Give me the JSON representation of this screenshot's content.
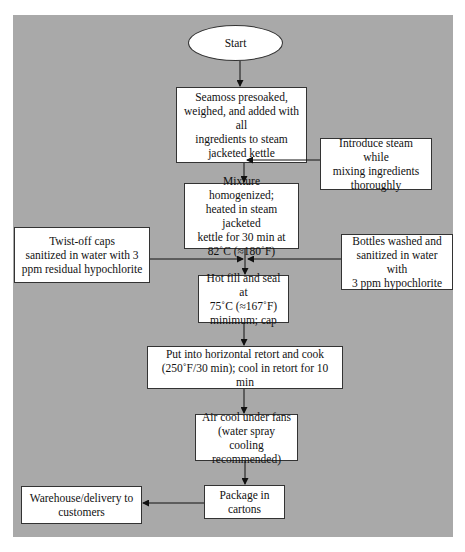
{
  "diagram": {
    "type": "process-flowchart",
    "background_color": "#a9a9a9",
    "nodes": {
      "start": "Start",
      "step1": "Seamoss presoaked,\nweighed, and added with all\ningredients to steam\njacketed kettle",
      "steam_input": "Introduce steam while\nmixing ingredients\nthoroughly",
      "step2": "Mixture homogenized;\nheated in steam jacketed\nkettle for 30 min at\n82˚C (≈180˚F)",
      "caps_input": "Twist-off caps\nsanitized in water with 3\nppm residual hypochlorite",
      "bottles_input": "Bottles washed and\nsanitized in water with\n3 ppm hypochlorite",
      "step3": "Hot fill and seal at\n75˚C (≈167˚F)\nminimum; cap",
      "step4": "Put into horizontal retort and cook\n(250˚F/30 min); cool in retort for 10 min",
      "step5": "Air cool under fans\n(water spray cooling\nrecommended)",
      "step6": "Package in\ncartons",
      "output": "Warehouse/delivery to\ncustomers"
    },
    "edges": [
      {
        "from": "start",
        "to": "step1"
      },
      {
        "from": "step1",
        "to": "step2"
      },
      {
        "from": "steam_input",
        "to": "step1-step2 connector"
      },
      {
        "from": "step2",
        "to": "step3"
      },
      {
        "from": "caps_input",
        "to": "step2-step3 connector"
      },
      {
        "from": "bottles_input",
        "to": "step2-step3 connector"
      },
      {
        "from": "step3",
        "to": "step4"
      },
      {
        "from": "step4",
        "to": "step5"
      },
      {
        "from": "step5",
        "to": "step6"
      },
      {
        "from": "step6",
        "to": "output"
      }
    ]
  }
}
